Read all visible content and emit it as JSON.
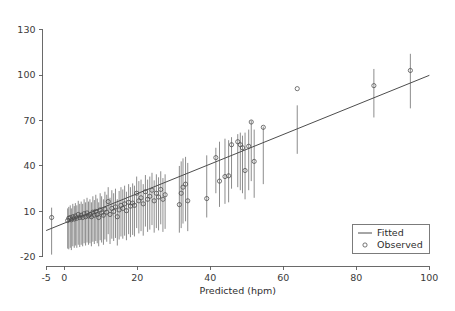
{
  "chart_data": {
    "type": "scatter",
    "title": "",
    "subtitle": "",
    "xlabel": "Predicted (hpm)",
    "ylabel": "",
    "xlim": [
      -6,
      101
    ],
    "ylim": [
      -26,
      133
    ],
    "xticks": [
      -5,
      0,
      20,
      40,
      60,
      80,
      100
    ],
    "xticklabels": [
      "-5",
      "0",
      "20",
      "40",
      "60",
      "80",
      "100"
    ],
    "yticks": [
      -20,
      10,
      40,
      70,
      100,
      130
    ],
    "yticklabels": [
      "-20",
      "10",
      "40",
      "70",
      "100",
      "130"
    ],
    "grid": false,
    "legend": {
      "position": "lower-right",
      "entries": [
        {
          "label": "Fitted",
          "marker": "line"
        },
        {
          "label": "Observed",
          "marker": "circle"
        }
      ]
    },
    "series": [
      {
        "name": "Fitted",
        "type": "line",
        "marker": "line",
        "color": "#4d4d4d",
        "x": [
          -5,
          100
        ],
        "y": [
          -2.6,
          99.8
        ]
      },
      {
        "name": "Observed",
        "type": "scatter-with-errorbars",
        "marker": "circle",
        "color": "#4a4a4a",
        "points": [
          {
            "x": -3.5,
            "y": 6.0,
            "lo": -18.5,
            "hi": 12.5
          },
          {
            "x": 0.9,
            "y": 4.0,
            "lo": -14.5,
            "hi": 12.0
          },
          {
            "x": 1.2,
            "y": 5.5,
            "lo": -15.0,
            "hi": 13.0
          },
          {
            "x": 1.6,
            "y": 6.0,
            "lo": -14.0,
            "hi": 14.0
          },
          {
            "x": 1.9,
            "y": 4.5,
            "lo": -15.5,
            "hi": 12.0
          },
          {
            "x": 2.3,
            "y": 6.5,
            "lo": -13.0,
            "hi": 15.0
          },
          {
            "x": 2.7,
            "y": 5.0,
            "lo": -14.0,
            "hi": 13.5
          },
          {
            "x": 3.0,
            "y": 7.0,
            "lo": -12.5,
            "hi": 15.5
          },
          {
            "x": 3.4,
            "y": 5.5,
            "lo": -14.0,
            "hi": 14.0
          },
          {
            "x": 3.8,
            "y": 8.0,
            "lo": -12.0,
            "hi": 17.0
          },
          {
            "x": 4.2,
            "y": 6.0,
            "lo": -13.5,
            "hi": 15.0
          },
          {
            "x": 4.6,
            "y": 7.5,
            "lo": -12.0,
            "hi": 16.5
          },
          {
            "x": 5.0,
            "y": 6.0,
            "lo": -13.0,
            "hi": 15.0
          },
          {
            "x": 5.4,
            "y": 8.5,
            "lo": -11.0,
            "hi": 18.0
          },
          {
            "x": 5.8,
            "y": 6.5,
            "lo": -12.5,
            "hi": 16.0
          },
          {
            "x": 6.2,
            "y": 9.0,
            "lo": -10.5,
            "hi": 19.0
          },
          {
            "x": 6.6,
            "y": 7.0,
            "lo": -12.0,
            "hi": 16.5
          },
          {
            "x": 7.0,
            "y": 8.0,
            "lo": -11.0,
            "hi": 18.0
          },
          {
            "x": 7.4,
            "y": 6.5,
            "lo": -13.0,
            "hi": 16.0
          },
          {
            "x": 7.8,
            "y": 9.5,
            "lo": -10.0,
            "hi": 20.0
          },
          {
            "x": 8.2,
            "y": 7.5,
            "lo": -11.5,
            "hi": 17.5
          },
          {
            "x": 8.6,
            "y": 10.0,
            "lo": -9.5,
            "hi": 21.0
          },
          {
            "x": 9.0,
            "y": 8.0,
            "lo": -11.0,
            "hi": 18.5
          },
          {
            "x": 9.4,
            "y": 6.0,
            "lo": -13.0,
            "hi": 16.0
          },
          {
            "x": 9.8,
            "y": 11.0,
            "lo": -9.0,
            "hi": 22.0
          },
          {
            "x": 10.2,
            "y": 9.0,
            "lo": -10.5,
            "hi": 20.0
          },
          {
            "x": 10.7,
            "y": 7.5,
            "lo": -12.0,
            "hi": 18.0
          },
          {
            "x": 11.1,
            "y": 11.5,
            "lo": -8.5,
            "hi": 23.0
          },
          {
            "x": 11.6,
            "y": 9.5,
            "lo": -10.0,
            "hi": 21.0
          },
          {
            "x": 12.0,
            "y": 16.5,
            "lo": -5.0,
            "hi": 26.0
          },
          {
            "x": 12.5,
            "y": 8.0,
            "lo": -11.5,
            "hi": 19.0
          },
          {
            "x": 13.0,
            "y": 12.0,
            "lo": -8.0,
            "hi": 24.0
          },
          {
            "x": 13.5,
            "y": 10.0,
            "lo": -9.5,
            "hi": 22.0
          },
          {
            "x": 14.0,
            "y": 13.0,
            "lo": -7.5,
            "hi": 25.0
          },
          {
            "x": 14.5,
            "y": 6.5,
            "lo": -12.5,
            "hi": 18.0
          },
          {
            "x": 15.0,
            "y": 11.0,
            "lo": -8.5,
            "hi": 23.5
          },
          {
            "x": 15.5,
            "y": 14.0,
            "lo": -6.5,
            "hi": 26.0
          },
          {
            "x": 16.0,
            "y": 12.0,
            "lo": -8.0,
            "hi": 24.5
          },
          {
            "x": 16.5,
            "y": 15.0,
            "lo": -6.0,
            "hi": 27.0
          },
          {
            "x": 17.0,
            "y": 10.5,
            "lo": -9.0,
            "hi": 23.0
          },
          {
            "x": 17.6,
            "y": 16.0,
            "lo": -5.0,
            "hi": 28.0
          },
          {
            "x": 18.1,
            "y": 13.5,
            "lo": -7.0,
            "hi": 26.0
          },
          {
            "x": 18.7,
            "y": 15.5,
            "lo": -5.5,
            "hi": 28.5
          },
          {
            "x": 19.2,
            "y": 14.0,
            "lo": -6.5,
            "hi": 27.0
          },
          {
            "x": 19.8,
            "y": 22.0,
            "lo": -1.0,
            "hi": 33.0
          },
          {
            "x": 20.4,
            "y": 17.0,
            "lo": -4.5,
            "hi": 30.0
          },
          {
            "x": 21.0,
            "y": 19.0,
            "lo": -3.0,
            "hi": 31.0
          },
          {
            "x": 21.6,
            "y": 15.0,
            "lo": -6.0,
            "hi": 28.0
          },
          {
            "x": 22.2,
            "y": 23.0,
            "lo": 0.0,
            "hi": 34.0
          },
          {
            "x": 22.8,
            "y": 18.0,
            "lo": -3.5,
            "hi": 31.0
          },
          {
            "x": 23.4,
            "y": 20.0,
            "lo": -2.0,
            "hi": 33.0
          },
          {
            "x": 24.0,
            "y": 24.0,
            "lo": 1.0,
            "hi": 35.5
          },
          {
            "x": 24.6,
            "y": 17.0,
            "lo": -4.0,
            "hi": 30.5
          },
          {
            "x": 25.2,
            "y": 22.0,
            "lo": -1.0,
            "hi": 34.5
          },
          {
            "x": 25.8,
            "y": 19.5,
            "lo": -2.5,
            "hi": 32.5
          },
          {
            "x": 26.4,
            "y": 24.5,
            "lo": 1.5,
            "hi": 36.5
          },
          {
            "x": 27.0,
            "y": 18.0,
            "lo": -3.5,
            "hi": 32.0
          },
          {
            "x": 27.6,
            "y": 21.0,
            "lo": -1.5,
            "hi": 34.5
          },
          {
            "x": 31.5,
            "y": 14.5,
            "lo": -4.0,
            "hi": 40.0
          },
          {
            "x": 32.0,
            "y": 22.0,
            "lo": -1.0,
            "hi": 43.0
          },
          {
            "x": 32.5,
            "y": 26.0,
            "lo": 2.0,
            "hi": 45.0
          },
          {
            "x": 33.2,
            "y": 28.0,
            "lo": 3.5,
            "hi": 46.0
          },
          {
            "x": 33.8,
            "y": 17.0,
            "lo": -3.0,
            "hi": 42.0
          },
          {
            "x": 39.0,
            "y": 18.5,
            "lo": 6.0,
            "hi": 47.0
          },
          {
            "x": 41.5,
            "y": 45.5,
            "lo": 22.0,
            "hi": 52.0
          },
          {
            "x": 42.5,
            "y": 30.0,
            "lo": 13.0,
            "hi": 56.0
          },
          {
            "x": 44.0,
            "y": 33.0,
            "lo": 15.0,
            "hi": 58.0
          },
          {
            "x": 45.0,
            "y": 33.5,
            "lo": 16.0,
            "hi": 57.0
          },
          {
            "x": 45.8,
            "y": 54.0,
            "lo": 25.0,
            "hi": 59.0
          },
          {
            "x": 47.5,
            "y": 56.0,
            "lo": 26.0,
            "hi": 61.0
          },
          {
            "x": 48.2,
            "y": 54.0,
            "lo": 24.0,
            "hi": 62.0
          },
          {
            "x": 48.8,
            "y": 52.0,
            "lo": 22.0,
            "hi": 60.0
          },
          {
            "x": 49.5,
            "y": 37.0,
            "lo": 18.0,
            "hi": 62.0
          },
          {
            "x": 50.5,
            "y": 53.0,
            "lo": 24.0,
            "hi": 64.0
          },
          {
            "x": 51.2,
            "y": 69.0,
            "lo": 30.0,
            "hi": 70.0
          },
          {
            "x": 52.0,
            "y": 43.0,
            "lo": 19.0,
            "hi": 64.0
          },
          {
            "x": 54.5,
            "y": 65.5,
            "lo": 28.0,
            "hi": 66.0
          },
          {
            "x": 63.8,
            "y": 91.0,
            "lo": 48.0,
            "hi": 80.0
          },
          {
            "x": 84.8,
            "y": 93.0,
            "lo": 72.0,
            "hi": 104.0
          },
          {
            "x": 94.8,
            "y": 103.0,
            "lo": 78.0,
            "hi": 114.0
          }
        ]
      }
    ]
  }
}
